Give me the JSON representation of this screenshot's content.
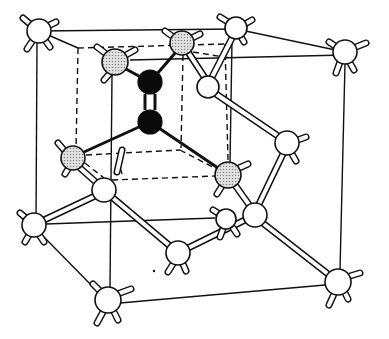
{
  "diagram": {
    "title": "",
    "legend": [],
    "colors": {
      "line": "#111111",
      "atom_white": "#ffffff",
      "atom_shaded": "#cfcfcf",
      "atom_black": "#0a0a0a",
      "background": "#ffffff"
    },
    "cube_front": [
      [
        39,
        31
      ],
      [
        345,
        50
      ],
      [
        338,
        282
      ],
      [
        34,
        225
      ]
    ],
    "cube_back": [
      [
        78,
        48
      ],
      [
        225,
        43
      ],
      [
        230,
        150
      ],
      [
        76,
        155
      ]
    ],
    "atoms": [
      {
        "id": "a1",
        "type": "white",
        "x": 39,
        "y": 31,
        "r": 12
      },
      {
        "id": "a2",
        "type": "white",
        "x": 236,
        "y": 28,
        "r": 11
      },
      {
        "id": "a3",
        "type": "white",
        "x": 345,
        "y": 52,
        "r": 12
      },
      {
        "id": "a4",
        "type": "shaded",
        "x": 115,
        "y": 62,
        "r": 13
      },
      {
        "id": "a5",
        "type": "shaded",
        "x": 182,
        "y": 43,
        "r": 12
      },
      {
        "id": "a6",
        "type": "black",
        "x": 150,
        "y": 82,
        "r": 12
      },
      {
        "id": "a7",
        "type": "black",
        "x": 150,
        "y": 122,
        "r": 12
      },
      {
        "id": "a8",
        "type": "white",
        "x": 208,
        "y": 87,
        "r": 11
      },
      {
        "id": "a9",
        "type": "white",
        "x": 287,
        "y": 143,
        "r": 12
      },
      {
        "id": "a10",
        "type": "shaded",
        "x": 73,
        "y": 158,
        "r": 12
      },
      {
        "id": "a11",
        "type": "shaded",
        "x": 228,
        "y": 175,
        "r": 13
      },
      {
        "id": "a12",
        "type": "white",
        "x": 104,
        "y": 190,
        "r": 12
      },
      {
        "id": "a13",
        "type": "white",
        "x": 255,
        "y": 215,
        "r": 12
      },
      {
        "id": "a14",
        "type": "white",
        "x": 226,
        "y": 219,
        "r": 10
      },
      {
        "id": "a15",
        "type": "white",
        "x": 34,
        "y": 225,
        "r": 12
      },
      {
        "id": "a16",
        "type": "white",
        "x": 178,
        "y": 253,
        "r": 12
      },
      {
        "id": "a17",
        "type": "white",
        "x": 108,
        "y": 300,
        "r": 13
      },
      {
        "id": "a18",
        "type": "white",
        "x": 338,
        "y": 282,
        "r": 13
      }
    ]
  }
}
